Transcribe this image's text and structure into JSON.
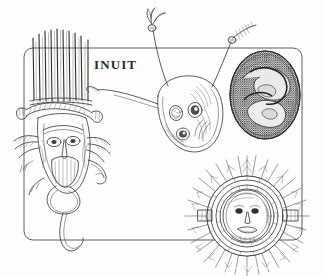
{
  "plate": {
    "culture_label": "INUIT",
    "width": 325,
    "height": 276,
    "background_color": "#fefefe",
    "ink_color": "#3a3a3a",
    "frame": {
      "type": "rounded-rectangle",
      "x": 24,
      "y": 48,
      "width": 278,
      "height": 192,
      "corner_radius": 9,
      "stroke_color": "#555555",
      "stroke_width": 1
    },
    "footer_rule": {
      "y": 268,
      "color": "#fafafa"
    }
  },
  "figures": [
    {
      "id": "quill-crown-mask",
      "name": "Quill-crowned face mask",
      "position": "left",
      "description": "Large vertical mask with tall comb of straight quills rising from the brow, braided headband, narrow elongated face, side hoops and dangling strap",
      "center_x": 72,
      "center_y": 140,
      "tone": "light-hatched"
    },
    {
      "id": "antennaed-mask",
      "name": "Antennaed oval mask",
      "position": "center",
      "description": "Rounded mask plaque with two asymmetric eye holes, a lower mouth hole, curved hatching, and two long feather-tipped antennae arcing above the frame",
      "center_x": 188,
      "center_y": 115,
      "tone": "light-hatched"
    },
    {
      "id": "coiled-oval-mask",
      "name": "Dark coiled oval mask",
      "position": "top-right",
      "description": "Densely stippled dark egg-shaped mask enclosing a spiral or coiled-serpent motif",
      "center_x": 265,
      "center_y": 95,
      "tone": "dark-stippled"
    },
    {
      "id": "feathered-sun-mask",
      "name": "Feathered sun-face mask",
      "position": "bottom-right",
      "description": "Concentric ringed disc mask with a small central face and a radiating halo of feather quills, plus two side bars",
      "center_x": 247,
      "center_y": 216,
      "tone": "medium-hatched"
    }
  ]
}
